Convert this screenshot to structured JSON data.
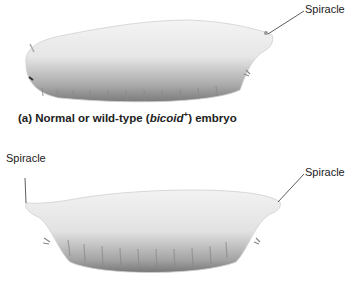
{
  "figure": {
    "panel_a": {
      "caption_prefix": "(a) Normal or wild-type (",
      "caption_gene": "bicoid",
      "caption_sup": "+",
      "caption_suffix": ") embryo",
      "labels": {
        "posterior_spiracle": "Spiracle"
      }
    },
    "panel_b": {
      "labels": {
        "anterior_spiracle": "Spiracle",
        "posterior_spiracle": "Spiracle"
      }
    }
  }
}
